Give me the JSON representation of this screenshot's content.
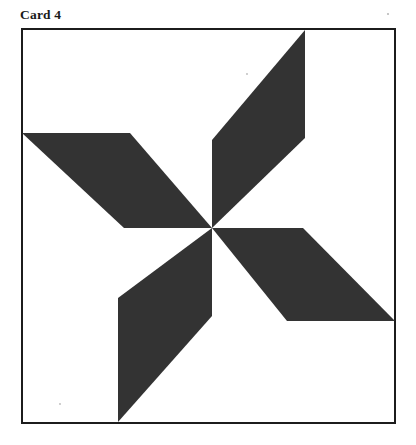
{
  "page": {
    "background_color": "#ffffff",
    "width": 416,
    "height": 445
  },
  "card": {
    "title": "Card 4",
    "title_color": "#1a1a1a"
  },
  "frame": {
    "name": "card-border",
    "stroke_color": "#1c1c1c",
    "stroke_width": 2,
    "fill_color": "#ffffff",
    "x": 21,
    "y": 28,
    "width": 375,
    "height": 396
  },
  "figure": {
    "name": "pinwheel-motif",
    "blade_color": "#333333",
    "background_color": "#ffffff",
    "center": {
      "x": 212,
      "y": 228
    },
    "blade_count": 4,
    "rotation_step_degrees": 90,
    "blades": [
      {
        "name": "blade-top",
        "points": "212,228 212,140 305,30 305,138"
      },
      {
        "name": "blade-left",
        "points": "212,228 124,228 22,133 130,133"
      },
      {
        "name": "blade-right",
        "points": "212,228 303,228 395,321 287,321"
      },
      {
        "name": "blade-bottom",
        "points": "212,228 212,316 118,422 118,298"
      }
    ]
  },
  "specks": [
    {
      "name": "paper-speck",
      "x": 388,
      "y": 14,
      "r": 1.1
    },
    {
      "name": "paper-speck",
      "x": 247,
      "y": 74,
      "r": 0.9
    },
    {
      "name": "paper-speck",
      "x": 60,
      "y": 404,
      "r": 0.9
    }
  ]
}
